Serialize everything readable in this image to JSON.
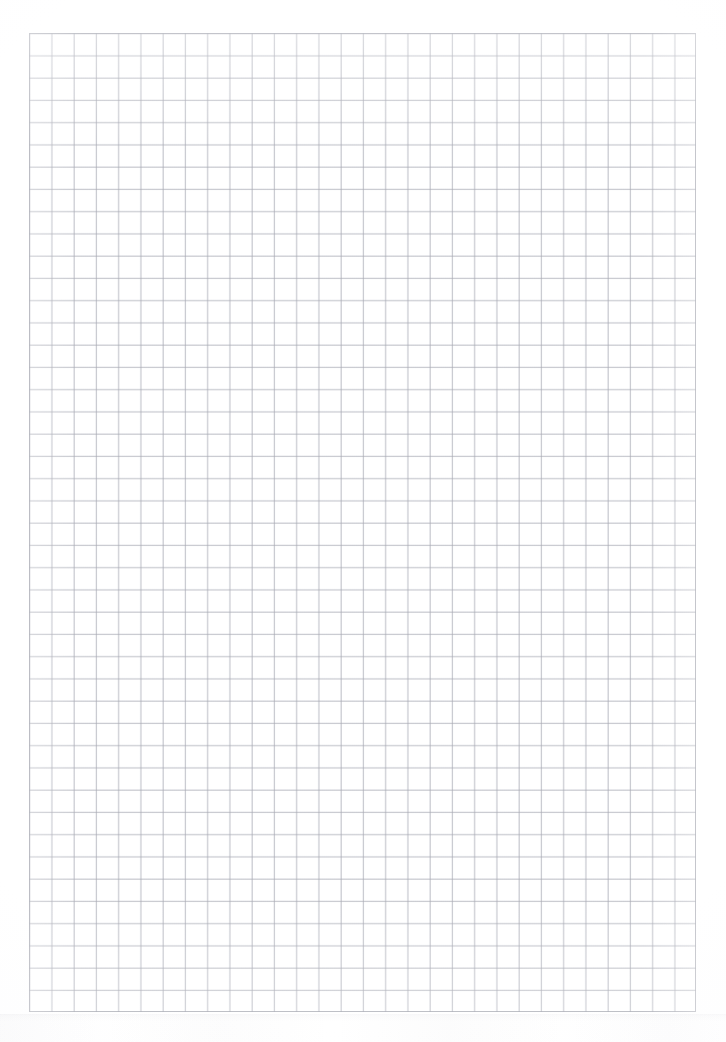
{
  "document": {
    "kind": "scanned-graph-paper",
    "title": "Blank quadrille graph paper sheet",
    "page_label": "",
    "content_text": "",
    "notes": ""
  },
  "sheet": {
    "page_width_px": 726,
    "page_height_px": 1042,
    "page_background": "#ffffff",
    "margin_left_px": 29,
    "margin_top_px": 33,
    "margin_right_px": 30,
    "margin_bottom_px": 30
  },
  "grid": {
    "x_px": 29,
    "y_px": 33,
    "width_px": 667,
    "height_px": 979,
    "cell_size_px": 22.25,
    "columns": 30,
    "rows": 44,
    "line_color": "#a8aab4",
    "minor_line_color": "#c4c6ce",
    "border_color": "#9ea0aa",
    "has_major_lines": false,
    "background": "#ffffff"
  },
  "artifacts": {
    "scan_banding_visible": true,
    "scan_banding_top_px": 1014,
    "scan_banding_height_px": 28,
    "scan_banding_color": "#8c8c96"
  }
}
